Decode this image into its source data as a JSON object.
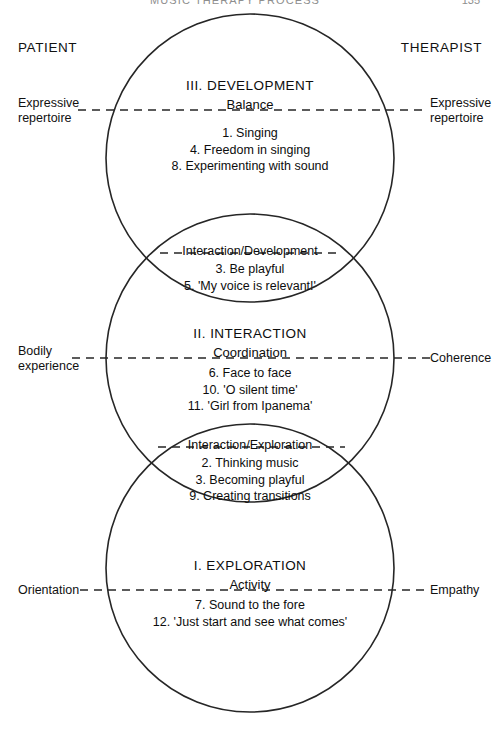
{
  "page": {
    "running_head": "MUSIC THERAPY PROCESS",
    "page_number": "135"
  },
  "columns": {
    "left_heading": "PATIENT",
    "right_heading": "THERAPIST"
  },
  "side_labels": {
    "left": [
      {
        "line1": "Expressive",
        "line2": "repertoire"
      },
      {
        "line1": "Bodily",
        "line2": "experience"
      },
      {
        "line1": "Orientation",
        "line2": ""
      }
    ],
    "right": [
      {
        "line1": "Expressive",
        "line2": "repertoire"
      },
      {
        "line1": "Coherence",
        "line2": ""
      },
      {
        "line1": "Empathy",
        "line2": ""
      }
    ]
  },
  "zones": [
    {
      "id": "development",
      "title": "III. DEVELOPMENT",
      "subtitle": "Balance",
      "items": [
        "1. Singing",
        "4. Freedom in singing",
        "8. Experimenting with sound"
      ]
    },
    {
      "id": "interaction",
      "title": "II. INTERACTION",
      "subtitle": "Coordination",
      "items": [
        "6. Face to face",
        "10. 'O silent time'",
        "11. 'Girl from Ipanema'"
      ]
    },
    {
      "id": "exploration",
      "title": "I. EXPLORATION",
      "subtitle": "Activity",
      "items": [
        "7. Sound to the fore",
        "12. 'Just start and see what comes'"
      ]
    }
  ],
  "overlaps": [
    {
      "id": "interaction-development",
      "title": "Interaction/Development",
      "items": [
        "3. Be playful",
        "5. 'My voice is relevant!'"
      ]
    },
    {
      "id": "interaction-exploration",
      "title": "Interaction/Exploration",
      "items": [
        "2. Thinking music",
        "3. Becoming playful",
        "9. Creating transitions"
      ]
    }
  ],
  "geometry": {
    "circles": [
      {
        "cx": 250,
        "cy": 158,
        "r": 144
      },
      {
        "cx": 250,
        "cy": 358,
        "r": 144
      },
      {
        "cx": 250,
        "cy": 568,
        "r": 144
      }
    ],
    "dashed_lines_y": [
      110,
      358,
      590
    ],
    "stroke_color": "#262626"
  }
}
